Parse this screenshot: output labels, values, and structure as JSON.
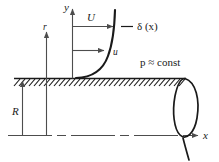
{
  "figure": {
    "colors": {
      "ink": "#1a1a1a",
      "thin": "#6b6b6b",
      "background": "#ffffff"
    },
    "labels": {
      "y_axis": "y",
      "x_axis": "x",
      "r_axis": "r",
      "radius": "R",
      "freestream_velocity": "U",
      "local_velocity": "u",
      "boundary_layer": "δ (x)",
      "pressure": "p ≈ const"
    },
    "geometry": {
      "wall_y": 78,
      "centerline_y": 135,
      "origin_x": 72,
      "curve_start_x": 100,
      "curve_top_x": 117,
      "pipe_end_x": 186
    }
  }
}
